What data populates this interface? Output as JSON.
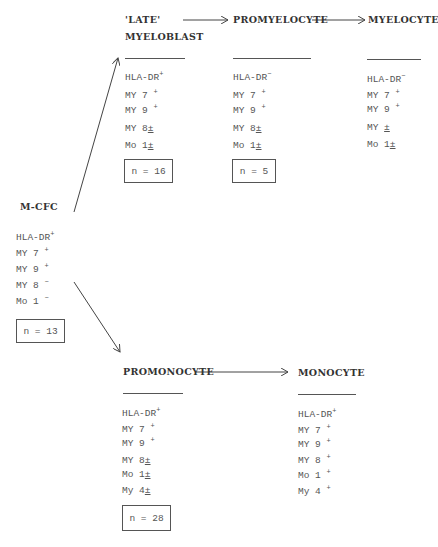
{
  "origin": {
    "title": "M-CFC",
    "markers": [
      {
        "name": "HLA-DR",
        "sign": "+"
      },
      {
        "name": "MY 7",
        "sign": "+"
      },
      {
        "name": "MY 9",
        "sign": "+"
      },
      {
        "name": "MY 8",
        "sign": "−"
      },
      {
        "name": "Mo 1",
        "sign": "−"
      }
    ],
    "n_label": "n = 13"
  },
  "granulocytic": [
    {
      "title_line1": "'LATE'",
      "title_line2": "MYELOBLAST",
      "markers": [
        {
          "name": "HLA-DR",
          "sign": "+"
        },
        {
          "name": "MY 7",
          "sign": "+"
        },
        {
          "name": "MY 9",
          "sign": "+"
        },
        {
          "name": "MY 8",
          "sign": "±"
        },
        {
          "name": "Mo 1",
          "sign": "±"
        }
      ],
      "n_label": "n = 16"
    },
    {
      "title_line1": "PROMYELOCYTE",
      "markers": [
        {
          "name": "HLA-DR",
          "sign": "−"
        },
        {
          "name": "MY 7",
          "sign": "+"
        },
        {
          "name": "MY 9",
          "sign": "+"
        },
        {
          "name": "MY 8",
          "sign": "±"
        },
        {
          "name": "Mo 1",
          "sign": "±"
        }
      ],
      "n_label": "n = 5"
    },
    {
      "title_line1": "MYELOCYTE",
      "markers": [
        {
          "name": "HLA-DR",
          "sign": "−"
        },
        {
          "name": "MY 7",
          "sign": "+"
        },
        {
          "name": "MY 9",
          "sign": "+"
        },
        {
          "name": "MY ",
          "sign": "±"
        },
        {
          "name": "Mo 1",
          "sign": "±"
        }
      ]
    }
  ],
  "monocytic": [
    {
      "title_line1": "PROMONOCYTE",
      "markers": [
        {
          "name": "HLA-DR",
          "sign": "+"
        },
        {
          "name": "MY 7",
          "sign": "+"
        },
        {
          "name": "MY 9",
          "sign": "+"
        },
        {
          "name": "MY 8",
          "sign": "±"
        },
        {
          "name": "Mo 1",
          "sign": "±"
        },
        {
          "name": "My 4",
          "sign": "±"
        }
      ],
      "n_label": "n = 28"
    },
    {
      "title_line1": "MONOCYTE",
      "markers": [
        {
          "name": "HLA-DR",
          "sign": "+"
        },
        {
          "name": "MY 7",
          "sign": "+"
        },
        {
          "name": "MY 9",
          "sign": "+"
        },
        {
          "name": "MY 8",
          "sign": "+"
        },
        {
          "name": "Mo 1",
          "sign": "+"
        },
        {
          "name": "My 4",
          "sign": "+"
        }
      ]
    }
  ]
}
